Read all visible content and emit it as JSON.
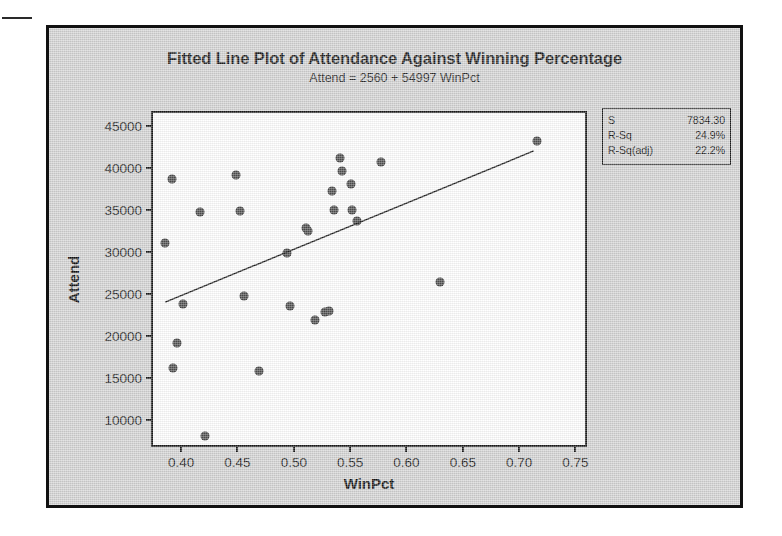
{
  "chart_data": {
    "type": "scatter",
    "title": "Fitted Line Plot of Attendance Against Winning Percentage",
    "subtitle": "Attend =  2560 + 54997 WinPct",
    "xlabel": "WinPct",
    "ylabel": "Attend",
    "xlim": [
      0.375,
      0.762
    ],
    "ylim": [
      6500,
      46500
    ],
    "xticks": [
      "0.40",
      "0.45",
      "0.50",
      "0.55",
      "0.60",
      "0.65",
      "0.70",
      "0.75"
    ],
    "xtick_values": [
      0.4,
      0.45,
      0.5,
      0.55,
      0.6,
      0.65,
      0.7,
      0.75
    ],
    "yticks": [
      "45000",
      "40000",
      "35000",
      "30000",
      "25000",
      "20000",
      "15000",
      "10000"
    ],
    "ytick_values": [
      45000,
      40000,
      35000,
      30000,
      25000,
      20000,
      15000,
      10000
    ],
    "grid": false,
    "legend": "none",
    "marker_color": "#4e4e4e",
    "line_color": "#1a1a1a",
    "points": [
      {
        "x": 0.386,
        "y": 31000
      },
      {
        "x": 0.392,
        "y": 38600
      },
      {
        "x": 0.393,
        "y": 16100
      },
      {
        "x": 0.396,
        "y": 19100
      },
      {
        "x": 0.402,
        "y": 23800
      },
      {
        "x": 0.417,
        "y": 34700
      },
      {
        "x": 0.421,
        "y": 8000
      },
      {
        "x": 0.449,
        "y": 39100
      },
      {
        "x": 0.452,
        "y": 34800
      },
      {
        "x": 0.456,
        "y": 24700
      },
      {
        "x": 0.469,
        "y": 15800
      },
      {
        "x": 0.494,
        "y": 29800
      },
      {
        "x": 0.497,
        "y": 23500
      },
      {
        "x": 0.511,
        "y": 32800
      },
      {
        "x": 0.513,
        "y": 32500
      },
      {
        "x": 0.519,
        "y": 21900
      },
      {
        "x": 0.528,
        "y": 22800
      },
      {
        "x": 0.531,
        "y": 22900
      },
      {
        "x": 0.534,
        "y": 37200
      },
      {
        "x": 0.536,
        "y": 35000
      },
      {
        "x": 0.541,
        "y": 41100
      },
      {
        "x": 0.543,
        "y": 39600
      },
      {
        "x": 0.551,
        "y": 38100
      },
      {
        "x": 0.552,
        "y": 34900
      },
      {
        "x": 0.556,
        "y": 33600
      },
      {
        "x": 0.577,
        "y": 40700
      },
      {
        "x": 0.63,
        "y": 26400
      },
      {
        "x": 0.716,
        "y": 43200
      }
    ],
    "fit_line": {
      "intercept": 2560,
      "slope": 54997,
      "x_start": 0.386,
      "x_end": 0.716,
      "equation": "Attend =  2560 + 54997 WinPct"
    }
  },
  "stats": {
    "rows": [
      {
        "label": "S",
        "value": "7834.30"
      },
      {
        "label": "R-Sq",
        "value": "24.9%"
      },
      {
        "label": "R-Sq(adj)",
        "value": "22.2%"
      }
    ]
  }
}
